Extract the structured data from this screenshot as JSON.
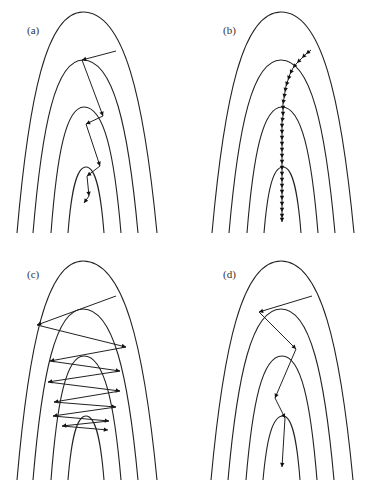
{
  "figure": {
    "panels": [
      {
        "id": "a",
        "label": "(a)",
        "label_pos": [
          27,
          25
        ],
        "contours": [
          {
            "peak": [
              83,
              12
            ],
            "bottom_left": [
              17,
              233
            ],
            "bottom_right": [
              157,
              233
            ]
          },
          {
            "peak": [
              83,
              60
            ],
            "bottom_left": [
              33,
              233
            ],
            "bottom_right": [
              138,
              233
            ]
          },
          {
            "peak": [
              84,
              107
            ],
            "bottom_left": [
              51,
              233
            ],
            "bottom_right": [
              121,
              233
            ]
          },
          {
            "peak": [
              86,
              167
            ],
            "bottom_left": [
              68,
              233
            ],
            "bottom_right": [
              104,
              233
            ]
          }
        ],
        "path": [
          [
            116,
            51
          ],
          [
            82,
            60
          ],
          [
            103,
            116
          ],
          [
            86,
            124
          ],
          [
            100,
            166
          ],
          [
            87,
            176
          ],
          [
            89,
            196
          ],
          [
            84,
            203
          ]
        ],
        "arrow_style": "per-segment"
      },
      {
        "id": "b",
        "label": "(b)",
        "label_pos": [
          223,
          25
        ],
        "contours": [
          {
            "peak": [
              281,
              12
            ],
            "bottom_left": [
              212,
              233
            ],
            "bottom_right": [
              354,
              233
            ]
          },
          {
            "peak": [
              281,
              60
            ],
            "bottom_left": [
              229,
              233
            ],
            "bottom_right": [
              335,
              233
            ]
          },
          {
            "peak": [
              282,
              107
            ],
            "bottom_left": [
              247,
              233
            ],
            "bottom_right": [
              318,
              233
            ]
          },
          {
            "peak": [
              283,
              167
            ],
            "bottom_left": [
              264,
              233
            ],
            "bottom_right": [
              301,
              233
            ]
          }
        ],
        "path": [
          [
            311,
            50
          ],
          [
            306,
            54
          ],
          [
            302,
            58
          ],
          [
            297,
            63
          ],
          [
            293,
            68
          ],
          [
            290,
            74
          ],
          [
            288,
            80
          ],
          [
            286,
            86
          ],
          [
            285,
            92
          ],
          [
            284,
            98
          ],
          [
            283,
            104
          ],
          [
            283,
            110
          ],
          [
            283,
            116
          ],
          [
            282,
            122
          ],
          [
            282,
            128
          ],
          [
            282,
            134
          ],
          [
            282,
            140
          ],
          [
            282,
            146
          ],
          [
            282,
            152
          ],
          [
            282,
            158
          ],
          [
            282,
            164
          ],
          [
            282,
            170
          ],
          [
            282,
            176
          ],
          [
            282,
            182
          ],
          [
            282,
            188
          ],
          [
            282,
            194
          ],
          [
            282,
            200
          ],
          [
            282,
            206
          ],
          [
            282,
            212
          ],
          [
            282,
            218
          ],
          [
            282,
            222
          ]
        ],
        "arrow_style": "per-segment"
      },
      {
        "id": "c",
        "label": "(c)",
        "label_pos": [
          27,
          269
        ],
        "contours": [
          {
            "peak": [
              83,
              261
            ],
            "bottom_left": [
              17,
              480
            ],
            "bottom_right": [
              157,
              480
            ]
          },
          {
            "peak": [
              83,
              309
            ],
            "bottom_left": [
              33,
              480
            ],
            "bottom_right": [
              138,
              480
            ]
          },
          {
            "peak": [
              84,
              356
            ],
            "bottom_left": [
              51,
              480
            ],
            "bottom_right": [
              121,
              480
            ]
          },
          {
            "peak": [
              86,
              416
            ],
            "bottom_left": [
              68,
              480
            ],
            "bottom_right": [
              104,
              480
            ]
          }
        ],
        "path": [
          [
            116,
            296
          ],
          [
            37,
            325
          ],
          [
            126,
            347
          ],
          [
            50,
            361
          ],
          [
            120,
            371
          ],
          [
            48,
            382
          ],
          [
            120,
            391
          ],
          [
            54,
            402
          ],
          [
            116,
            407
          ],
          [
            53,
            416
          ],
          [
            109,
            421
          ],
          [
            62,
            426
          ],
          [
            108,
            430
          ]
        ],
        "arrow_style": "per-segment"
      },
      {
        "id": "d",
        "label": "(d)",
        "label_pos": [
          223,
          269
        ],
        "contours": [
          {
            "peak": [
              281,
              261
            ],
            "bottom_left": [
              211,
              480
            ],
            "bottom_right": [
              353,
              480
            ]
          },
          {
            "peak": [
              281,
              309
            ],
            "bottom_left": [
              228,
              480
            ],
            "bottom_right": [
              334,
              480
            ]
          },
          {
            "peak": [
              282,
              356
            ],
            "bottom_left": [
              246,
              480
            ],
            "bottom_right": [
              317,
              480
            ]
          },
          {
            "peak": [
              283,
              416
            ],
            "bottom_left": [
              263,
              480
            ],
            "bottom_right": [
              300,
              480
            ]
          }
        ],
        "path": [
          [
            312,
            296
          ],
          [
            259,
            312
          ],
          [
            296,
            349
          ],
          [
            275,
            398
          ],
          [
            285,
            418
          ],
          [
            282,
            467
          ]
        ],
        "arrow_style": "per-segment"
      }
    ]
  }
}
